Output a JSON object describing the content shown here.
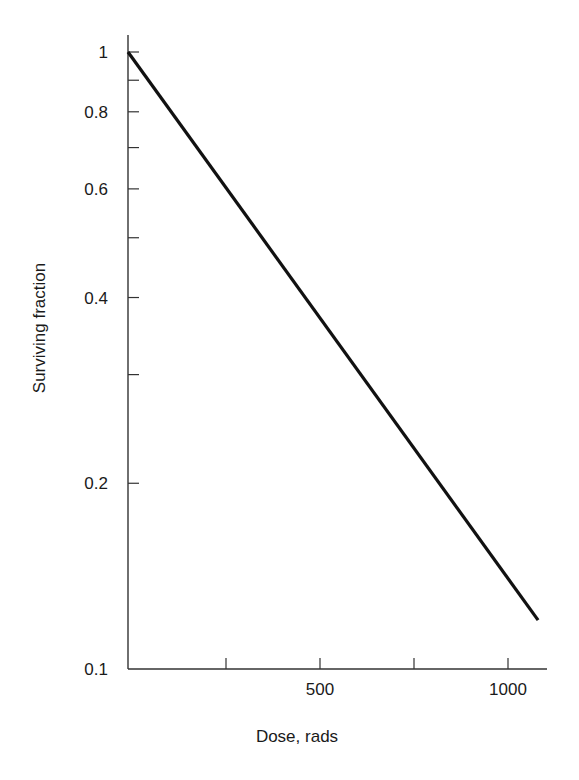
{
  "chart_data": {
    "type": "line",
    "title": "",
    "xlabel": "Dose, rads",
    "ylabel": "Surviving fraction",
    "yscale": "log",
    "xlim": [
      0,
      1100
    ],
    "ylim": [
      0.1,
      1.05
    ],
    "x_ticks": [
      250,
      500,
      750,
      1000
    ],
    "x_tick_labels": [
      {
        "value": 500,
        "label": "500"
      },
      {
        "value": 1000,
        "label": "1000"
      }
    ],
    "y_ticks": [
      1,
      0.9,
      0.8,
      0.7,
      0.6,
      0.5,
      0.4,
      0.3,
      0.2
    ],
    "y_tick_labels": [
      {
        "value": 1,
        "label": "1"
      },
      {
        "value": 0.8,
        "label": "0.8"
      },
      {
        "value": 0.6,
        "label": "0.6"
      },
      {
        "value": 0.4,
        "label": "0.4"
      },
      {
        "value": 0.2,
        "label": "0.2"
      },
      {
        "value": 0.1,
        "label": "0.1"
      }
    ],
    "grid": false,
    "legend": null,
    "series": [
      {
        "name": "survival curve",
        "x": [
          0,
          1080
        ],
        "y": [
          1.0,
          0.12
        ]
      }
    ]
  }
}
